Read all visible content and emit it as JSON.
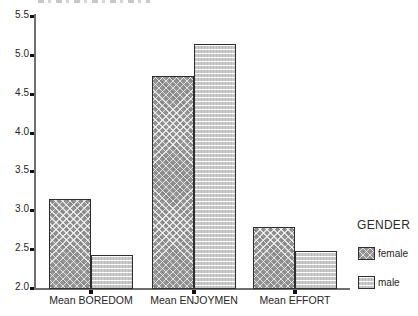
{
  "chart_data": {
    "type": "bar",
    "categories": [
      "Mean BOREDOM",
      "Mean ENJOYMEN",
      "Mean EFFORT"
    ],
    "series": [
      {
        "name": "female",
        "pattern": "crosshatch",
        "color": "#969696",
        "values": [
          3.14,
          4.73,
          2.78
        ]
      },
      {
        "name": "male",
        "pattern": "horizontal-lines",
        "color": "#cbcbcb",
        "values": [
          2.43,
          5.14,
          2.48
        ]
      }
    ],
    "title": "",
    "xlabel": "",
    "ylabel": "",
    "ylim": [
      2.0,
      5.5
    ],
    "ytick_values": [
      5.5,
      5.0,
      4.5,
      4.0,
      3.5,
      3.0,
      2.5,
      2.0
    ],
    "ytick_labels": [
      "5.5",
      "5.0",
      "4.5",
      "4.0",
      "3.5",
      "3.0",
      "2.5",
      "2.0"
    ],
    "grid": false,
    "legend": {
      "title": "GENDER",
      "position": "right",
      "entries": [
        {
          "label": "female",
          "pattern": "crosshatch"
        },
        {
          "label": "male",
          "pattern": "horizontal-lines"
        }
      ]
    }
  },
  "colors": {
    "background": "#ffffff",
    "axis": "#6f6f6f",
    "tick": "#111111",
    "text": "#262626",
    "bar_border": "#2e2e2e",
    "female_fill": "#969696",
    "male_fill": "#cbcbcb"
  }
}
